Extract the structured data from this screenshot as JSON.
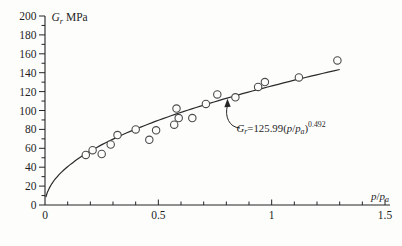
{
  "figure": {
    "background": "#fdfdfc",
    "ink_color": "#242424",
    "point_stroke_color": "#4b4b4b",
    "curve_color": "#2a2a2a"
  },
  "chart_data": {
    "type": "scatter",
    "title": "",
    "x_axis": {
      "label_plain": "p/pa",
      "label_parts": [
        {
          "t": "p",
          "s": "i"
        },
        {
          "t": "/",
          "s": "n"
        },
        {
          "t": "p",
          "s": "i"
        },
        {
          "t": "a",
          "s": "isub"
        }
      ],
      "min": 0,
      "max": 1.5,
      "major_ticks": [
        0,
        0.5,
        1,
        1.5
      ],
      "major_tick_labels": [
        "0",
        "0.5",
        "1",
        "1.5"
      ],
      "minor_tick_step": 0.1
    },
    "y_axis": {
      "label_plain": "Gr MPa",
      "label_parts": [
        {
          "t": "G",
          "s": "i"
        },
        {
          "t": "r",
          "s": "isub"
        },
        {
          "t": " MPa",
          "s": "n"
        }
      ],
      "min": 0,
      "max": 200,
      "major_tick_step": 20,
      "minor_tick_step": 10,
      "major_tick_labels": [
        "0",
        "20",
        "40",
        "60",
        "80",
        "100",
        "120",
        "140",
        "160",
        "180",
        "200"
      ]
    },
    "grid": false,
    "points": [
      [
        0.18,
        53
      ],
      [
        0.21,
        58
      ],
      [
        0.25,
        54
      ],
      [
        0.29,
        64
      ],
      [
        0.32,
        74
      ],
      [
        0.4,
        80
      ],
      [
        0.46,
        69
      ],
      [
        0.49,
        79
      ],
      [
        0.57,
        85
      ],
      [
        0.58,
        102
      ],
      [
        0.59,
        92
      ],
      [
        0.65,
        92
      ],
      [
        0.71,
        107
      ],
      [
        0.76,
        117
      ],
      [
        0.84,
        114
      ],
      [
        0.94,
        125
      ],
      [
        0.97,
        130
      ],
      [
        1.12,
        135
      ],
      [
        1.29,
        153
      ]
    ],
    "fit_curve": {
      "type": "power",
      "coefficient": 125.99,
      "exponent": 0.492,
      "x_start": 0.004,
      "x_end": 1.3
    },
    "annotation": {
      "equation_plain": "Gr=125.99(p/pa)^0.492",
      "points_to_x": 0.807,
      "parts": [
        {
          "t": "G",
          "s": "i"
        },
        {
          "t": "r",
          "s": "isub"
        },
        {
          "t": "=125.99(",
          "s": "n"
        },
        {
          "t": "p",
          "s": "i"
        },
        {
          "t": "/",
          "s": "n"
        },
        {
          "t": "p",
          "s": "i"
        },
        {
          "t": "a",
          "s": "isub"
        },
        {
          "t": ")",
          "s": "n"
        },
        {
          "t": "0.492",
          "s": "sup"
        }
      ]
    }
  }
}
